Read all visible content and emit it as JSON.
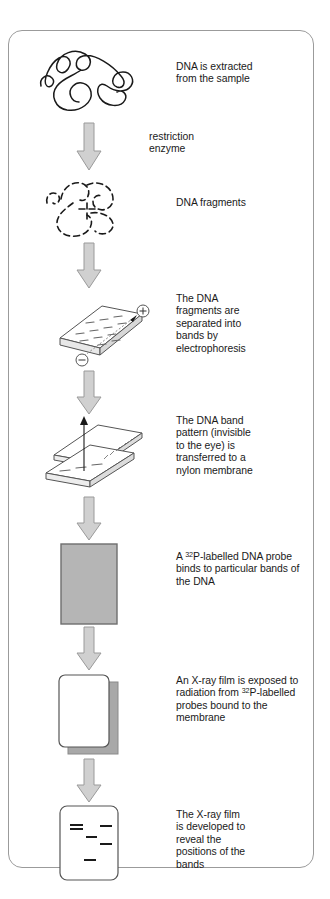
{
  "figure": {
    "type": "flowchart-diagram",
    "topic": "DNA fingerprinting / Southern blotting procedure",
    "colors": {
      "frame_border": "#9b9b9b",
      "arrow_fill": "#d0d0d0",
      "arrow_stroke": "#9a9a9a",
      "membrane_fill": "#b5b5b5",
      "membrane_stroke": "#6e6e6e",
      "shadow_fill": "#a8a8a8",
      "ink": "#1a1a1a",
      "gel_fill": "#ffffff",
      "gel_stroke": "#555555"
    }
  },
  "stages": [
    {
      "id": "dna-extraction",
      "icon": "tangled-dna-strand-icon",
      "caption_lines": [
        "DNA is extracted",
        "from the sample"
      ]
    },
    {
      "id": "dna-fragments",
      "icon": "fragmented-dna-strand-icon",
      "caption_lines": [
        "DNA fragments"
      ]
    },
    {
      "id": "electrophoresis",
      "icon": "electrophoresis-gel-icon",
      "caption_lines": [
        "The DNA",
        "fragments are",
        "separated into",
        "bands by",
        "electrophoresis"
      ],
      "electrodes": {
        "positive": "+",
        "negative": "−"
      }
    },
    {
      "id": "membrane-transfer",
      "icon": "gel-to-membrane-transfer-icon",
      "caption_lines": [
        "The DNA band",
        "pattern (invisible",
        "to the eye) is",
        "transferred to a",
        "nylon membrane"
      ]
    },
    {
      "id": "probe-binding",
      "icon": "nylon-membrane-icon",
      "caption_html": "A <sup>32</sup>P-labelled DNA probe binds to particular bands of the DNA"
    },
    {
      "id": "xray-exposure",
      "icon": "xray-film-icon",
      "caption_html": "An X-ray film is exposed to radiation from <sup>32</sup>P-labelled probes bound to the membrane"
    },
    {
      "id": "film-developed",
      "icon": "developed-film-bands-icon",
      "caption_lines": [
        "The X-ray film",
        "is developed to",
        "reveal the",
        "positions of the",
        "bands"
      ]
    }
  ],
  "arrows": [
    {
      "id": "arrow-restriction-enzyme",
      "label_lines": [
        "restriction",
        "enzyme"
      ]
    },
    {
      "id": "arrow-to-electrophoresis",
      "label_lines": []
    },
    {
      "id": "arrow-to-transfer",
      "label_lines": []
    },
    {
      "id": "arrow-to-probe",
      "label_lines": []
    },
    {
      "id": "arrow-to-xray",
      "label_lines": []
    },
    {
      "id": "arrow-to-develop",
      "label_lines": []
    }
  ],
  "developed_bands": [
    {
      "lane": "left",
      "x": 14,
      "y": 16,
      "w": 13
    },
    {
      "lane": "left",
      "x": 14,
      "y": 20,
      "w": 13
    },
    {
      "lane": "mid",
      "x": 30,
      "y": 28,
      "w": 11
    },
    {
      "lane": "right",
      "x": 44,
      "y": 17,
      "w": 12
    },
    {
      "lane": "right",
      "x": 44,
      "y": 35,
      "w": 12
    },
    {
      "lane": "mid",
      "x": 28,
      "y": 51,
      "w": 12
    }
  ]
}
